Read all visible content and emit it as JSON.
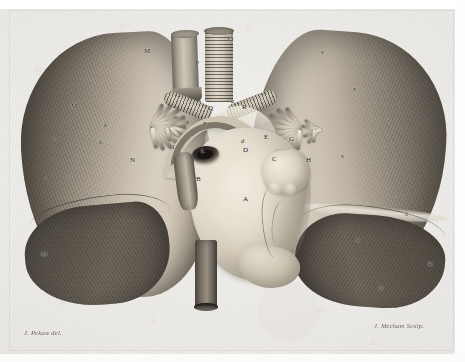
{
  "plate": {
    "domain": "Natural-Image",
    "kind": "anatomical-copperplate-engraving",
    "subject": "Heart and lungs in situ, anterior view",
    "medium": "line and stipple engraving on laid paper",
    "dimensions": {
      "width": 465,
      "height": 362
    }
  },
  "palette": {
    "paper": "#eae8e4",
    "paper_light": "#f2f1ee",
    "ink_dark": "#4a453e",
    "ink_darkest": "#23201b",
    "lung_shadow": "#514c45",
    "lung_midtone": "#837b6f",
    "lung_highlight": "#d4ccbe",
    "heart_highlight": "#f1ece0",
    "heart_midtone": "#d6cdbb",
    "heart_shadow": "#a49b8a",
    "vessel_dark": "#15120f",
    "margin_white": "#ffffff"
  },
  "signatures": {
    "artist": "J. Pekaw del.",
    "engraver": "J. Mecham Sculp."
  },
  "labels": [
    {
      "id": "A",
      "text": "A",
      "x": 243,
      "y": 196,
      "style": "roman",
      "note": "body of the heart / left ventricle"
    },
    {
      "id": "B",
      "text": "B",
      "x": 196,
      "y": 176,
      "style": "roman",
      "note": "ascending vessel, vena cava"
    },
    {
      "id": "C",
      "text": "C",
      "x": 272,
      "y": 156,
      "style": "roman",
      "note": "right auricle / appendage"
    },
    {
      "id": "D",
      "text": "D",
      "x": 243,
      "y": 147,
      "style": "roman",
      "note": "base of the heart"
    },
    {
      "id": "E",
      "text": "E",
      "x": 264,
      "y": 134,
      "style": "roman",
      "note": "right pulmonary vessels"
    },
    {
      "id": "F",
      "text": "F",
      "x": 203,
      "y": 121,
      "style": "roman",
      "note": "left pulmonary artery"
    },
    {
      "id": "G",
      "text": "G",
      "x": 289,
      "y": 136,
      "style": "roman",
      "note": "right pulmonary branch"
    },
    {
      "id": "H",
      "text": "H",
      "x": 306,
      "y": 157,
      "style": "roman",
      "note": "right hilar vessel fan"
    },
    {
      "id": "I",
      "text": "I",
      "x": 172,
      "y": 144,
      "style": "roman",
      "note": "left hilar vessel fan"
    },
    {
      "id": "L",
      "text": "L",
      "x": 201,
      "y": 148,
      "style": "roman",
      "note": "cut pulmonary artery orifice"
    },
    {
      "id": "D2",
      "text": "d",
      "x": 241,
      "y": 138,
      "style": "italic",
      "note": "small vessel at heart base"
    },
    {
      "id": "O",
      "text": "O",
      "x": 228,
      "y": 36,
      "style": "roman",
      "note": "trachea, cut superiorly"
    },
    {
      "id": "P",
      "text": "P",
      "x": 195,
      "y": 60,
      "style": "roman",
      "note": "oesophagus, cut tube"
    },
    {
      "id": "Q",
      "text": "Q",
      "x": 208,
      "y": 105,
      "style": "roman",
      "note": "left bronchus"
    },
    {
      "id": "R",
      "text": "R",
      "x": 242,
      "y": 104,
      "style": "roman",
      "note": "right bronchus"
    },
    {
      "id": "Ra",
      "text": "a",
      "x": 231,
      "y": 98,
      "style": "italic",
      "note": "bronchial bifurcation"
    },
    {
      "id": "M1",
      "text": "M",
      "x": 144,
      "y": 48,
      "style": "roman",
      "note": "left lung, upper lobe"
    },
    {
      "id": "M2",
      "text": "M",
      "x": 71,
      "y": 103,
      "style": "roman",
      "note": "left lung, outer margin"
    },
    {
      "id": "M3",
      "text": "M",
      "x": 41,
      "y": 251,
      "style": "roman",
      "note": "left lung, lower lobe"
    },
    {
      "id": "N",
      "text": "N",
      "x": 130,
      "y": 157,
      "style": "roman",
      "note": "left lung, mediastinal surface"
    },
    {
      "id": "K1",
      "text": "k",
      "x": 104,
      "y": 122,
      "style": "italic",
      "note": "left lung fissure"
    },
    {
      "id": "K2",
      "text": "k",
      "x": 99,
      "y": 139,
      "style": "italic",
      "note": "left lung fissure, lower"
    },
    {
      "id": "L1",
      "text": "l",
      "x": 45,
      "y": 175,
      "style": "italic",
      "note": "left lung border"
    },
    {
      "id": "L2",
      "text": "l",
      "x": 54,
      "y": 136,
      "style": "italic",
      "note": "left lung border, upper"
    },
    {
      "id": "S1",
      "text": "s",
      "x": 321,
      "y": 49,
      "style": "roman",
      "note": "right lung, upper lobe"
    },
    {
      "id": "S2",
      "text": "s",
      "x": 353,
      "y": 86,
      "style": "roman",
      "note": "right lung, outer margin"
    },
    {
      "id": "S3",
      "text": "s",
      "x": 396,
      "y": 158,
      "style": "roman",
      "note": "right lung, middle lobe"
    },
    {
      "id": "S4",
      "text": "s",
      "x": 341,
      "y": 153,
      "style": "roman",
      "note": "right lung, mediastinal surface"
    },
    {
      "id": "H2",
      "text": "h",
      "x": 405,
      "y": 211,
      "style": "italic",
      "note": "right lung fissure"
    },
    {
      "id": "A2",
      "text": "A",
      "x": 356,
      "y": 237,
      "style": "italic",
      "note": "right lung lower border"
    },
    {
      "id": "R2",
      "text": "R",
      "x": 428,
      "y": 261,
      "style": "roman",
      "note": "right lung, lower lobe"
    },
    {
      "id": "N2",
      "text": "N",
      "x": 379,
      "y": 285,
      "style": "italic",
      "note": "right lung lower lobe surface"
    }
  ]
}
